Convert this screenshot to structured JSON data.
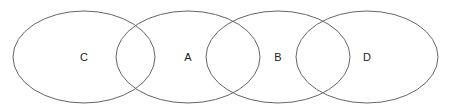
{
  "diagram": {
    "type": "overlapping-ellipses",
    "stroke_color": "#666666",
    "fill_color": "#ffffff",
    "nodes": [
      {
        "label": "C",
        "cx": 84,
        "cy": 57,
        "rx": 71,
        "ry": 46
      },
      {
        "label": "A",
        "cx": 188,
        "cy": 57,
        "rx": 72,
        "ry": 46
      },
      {
        "label": "B",
        "cx": 278,
        "cy": 57,
        "rx": 72,
        "ry": 46
      },
      {
        "label": "D",
        "cx": 367,
        "cy": 57,
        "rx": 71,
        "ry": 46
      }
    ]
  }
}
